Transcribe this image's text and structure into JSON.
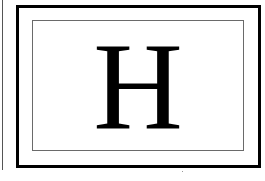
{
  "card": {
    "letter": "H",
    "colors": {
      "frame": "#000000",
      "inner_frame": "#6a6a6a",
      "letter": "#000000",
      "background": "#ffffff"
    }
  }
}
